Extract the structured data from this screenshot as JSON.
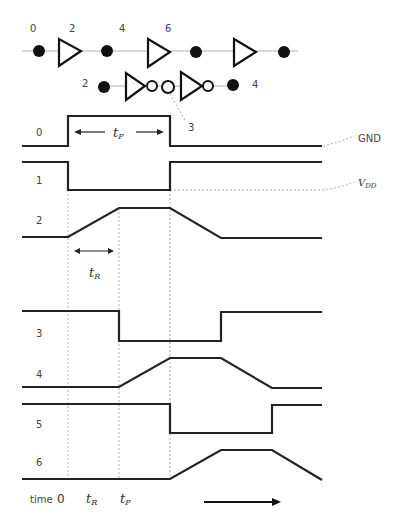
{
  "chain_top": {
    "node_labels": [
      "0",
      "2",
      "4",
      "6"
    ],
    "gate_type": "buffer",
    "gate_count": 3
  },
  "chain_bottom": {
    "node_labels": [
      "2",
      "4"
    ],
    "callout_label": "3",
    "gate_type": "inverter",
    "gate_count": 2
  },
  "signals": [
    {
      "label": "0",
      "levels": [
        "low",
        "high",
        "high",
        "low",
        "low",
        "low",
        "low"
      ],
      "shape": "square"
    },
    {
      "label": "1",
      "levels": [
        "high",
        "low",
        "low",
        "high",
        "high",
        "high",
        "high"
      ],
      "shape": "square"
    },
    {
      "label": "2",
      "levels": [
        "low",
        "rise",
        "high",
        "fall",
        "low",
        "low"
      ],
      "shape": "ramp"
    },
    {
      "label": "3",
      "levels": [
        "high",
        "high",
        "low",
        "low",
        "high",
        "high"
      ],
      "shape": "square"
    },
    {
      "label": "4",
      "levels": [
        "low",
        "low",
        "rise",
        "high",
        "fall",
        "low"
      ],
      "shape": "ramp"
    },
    {
      "label": "5",
      "levels": [
        "high",
        "high",
        "high",
        "low",
        "low",
        "high"
      ],
      "shape": "square"
    },
    {
      "label": "6",
      "levels": [
        "low",
        "low",
        "low",
        "rise",
        "high",
        "fall"
      ],
      "shape": "ramp"
    }
  ],
  "annotations": {
    "tp_label": "t",
    "tp_sub": "P",
    "tr_label": "t",
    "tr_sub": "R",
    "gnd_label": "GND",
    "vdd_label": "V",
    "vdd_sub": "DD"
  },
  "time_axis": {
    "label": "time",
    "zero": "0",
    "tr": "t",
    "tr_sub": "R",
    "tp": "t",
    "tp_sub": "P",
    "direction": "right"
  }
}
